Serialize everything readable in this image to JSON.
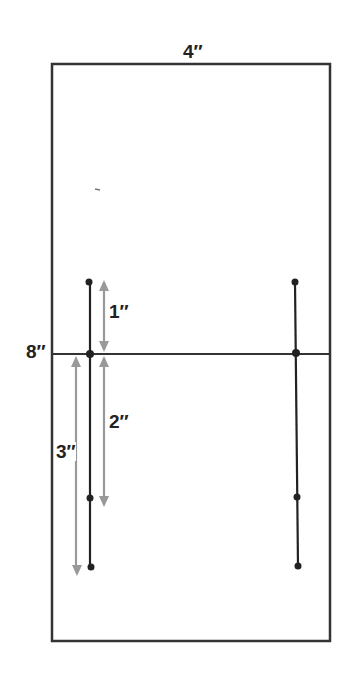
{
  "diagram": {
    "paper": {
      "width_label": "4″",
      "height_label": "8″"
    },
    "measurements": [
      {
        "id": "m1",
        "label": "1″"
      },
      {
        "id": "m2",
        "label": "2″"
      },
      {
        "id": "m3",
        "label": "3″"
      }
    ],
    "colors": {
      "line": "#222222",
      "arrow": "#999999",
      "background": "#ffffff"
    }
  }
}
